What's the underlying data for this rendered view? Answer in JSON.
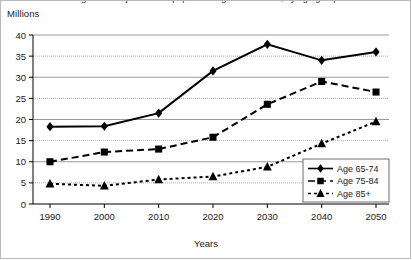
{
  "chart_data": {
    "type": "line",
    "title": "Figure 1. Projected U.S. population age 65 and over, by age group",
    "ylabel": "Millions",
    "xlabel": "Years",
    "categories": [
      "1990",
      "2000",
      "2010",
      "2020",
      "2030",
      "2040",
      "2050"
    ],
    "x": [
      1990,
      2000,
      2010,
      2020,
      2030,
      2040,
      2050
    ],
    "ylim": [
      0,
      40
    ],
    "ytick_values": [
      0,
      5,
      10,
      15,
      20,
      25,
      30,
      35,
      40
    ],
    "ytick_labels": [
      "0",
      "5",
      "10",
      "15",
      "20",
      "25",
      "30",
      "35",
      "40"
    ],
    "grid": true,
    "grid_axis": "y",
    "legend_position": "bottom-right",
    "series": [
      {
        "name": "Age 65-74",
        "marker": "diamond",
        "line_style": "solid",
        "color": "#000000",
        "values": [
          18.3,
          18.4,
          21.5,
          31.5,
          37.8,
          34.0,
          36.0
        ]
      },
      {
        "name": "Age 75-84",
        "marker": "square",
        "line_style": "dashed",
        "color": "#000000",
        "values": [
          10.0,
          12.3,
          13.0,
          15.8,
          23.6,
          29.0,
          26.5
        ]
      },
      {
        "name": "Age 85+",
        "marker": "triangle",
        "line_style": "dotted",
        "color": "#000000",
        "values": [
          4.8,
          4.3,
          5.8,
          6.5,
          8.8,
          14.3,
          19.5
        ]
      }
    ]
  },
  "colors": {
    "series": "#000000",
    "gridline": "#9a9a9a",
    "axis": "#000000",
    "frame": "#b9b9b9",
    "background": "#ffffff"
  }
}
